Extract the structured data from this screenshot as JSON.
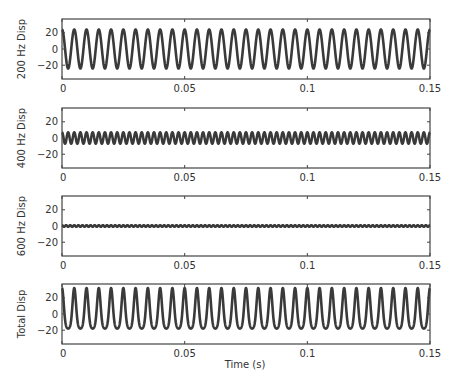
{
  "figure": {
    "xlabel": "Time (s)",
    "line_color": "#3a3a3a",
    "axis_color": "#444444"
  },
  "chart_data": [
    {
      "type": "line",
      "title": "",
      "ylabel": "200 Hz Disp",
      "xlabel": "",
      "xlim": [
        0,
        0.15
      ],
      "ylim": [
        -37,
        37
      ],
      "xticks": [
        0,
        0.05,
        0.1,
        0.15
      ],
      "xtick_labels": [
        "0",
        "0.05",
        "0.1",
        "0.15"
      ],
      "yticks": [
        -20,
        0,
        20
      ],
      "ytick_labels": [
        "-20",
        "0",
        "20"
      ],
      "grid": false,
      "series": [
        {
          "name": "200 Hz",
          "frequency_hz": 200,
          "amplitude": 24,
          "phase": "cosine"
        }
      ]
    },
    {
      "type": "line",
      "title": "",
      "ylabel": "400 Hz Disp",
      "xlabel": "",
      "xlim": [
        0,
        0.15
      ],
      "ylim": [
        -37,
        37
      ],
      "xticks": [
        0,
        0.05,
        0.1,
        0.15
      ],
      "xtick_labels": [
        "0",
        "0.05",
        "0.1",
        "0.15"
      ],
      "yticks": [
        -20,
        0,
        20
      ],
      "ytick_labels": [
        "-20",
        "0",
        "20"
      ],
      "grid": false,
      "series": [
        {
          "name": "400 Hz",
          "frequency_hz": 400,
          "amplitude": 7,
          "phase": "cosine"
        }
      ]
    },
    {
      "type": "line",
      "title": "",
      "ylabel": "600 Hz Disp",
      "xlabel": "",
      "xlim": [
        0,
        0.15
      ],
      "ylim": [
        -37,
        37
      ],
      "xticks": [
        0,
        0.05,
        0.1,
        0.15
      ],
      "xtick_labels": [
        "0",
        "0.05",
        "0.1",
        "0.15"
      ],
      "yticks": [
        -20,
        0,
        20
      ],
      "ytick_labels": [
        "-20",
        "0",
        "20"
      ],
      "grid": false,
      "series": [
        {
          "name": "600 Hz",
          "frequency_hz": 600,
          "amplitude": 1,
          "phase": "cosine"
        }
      ]
    },
    {
      "type": "line",
      "title": "",
      "ylabel": "Total Disp",
      "xlabel": "Time (s)",
      "xlim": [
        0,
        0.15
      ],
      "ylim": [
        -37,
        37
      ],
      "xticks": [
        0,
        0.05,
        0.1,
        0.15
      ],
      "xtick_labels": [
        "0",
        "0.05",
        "0.1",
        "0.15"
      ],
      "yticks": [
        -20,
        0,
        20
      ],
      "ytick_labels": [
        "-20",
        "0",
        "20"
      ],
      "grid": false,
      "series": [
        {
          "name": "Total",
          "components": [
            {
              "frequency_hz": 200,
              "amplitude": 24
            },
            {
              "frequency_hz": 400,
              "amplitude": 7
            },
            {
              "frequency_hz": 600,
              "amplitude": 1
            }
          ]
        }
      ]
    }
  ]
}
